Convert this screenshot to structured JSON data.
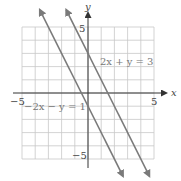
{
  "chart_data": {
    "type": "line",
    "title": "",
    "xlabel": "x",
    "ylabel": "y",
    "xlim": [
      -5,
      5
    ],
    "ylim": [
      -5,
      5
    ],
    "grid": true,
    "tick_labels": {
      "x": [
        "-5",
        "5"
      ],
      "y": [
        "5",
        "-5"
      ]
    },
    "series": [
      {
        "name": "2x + y = 3",
        "equation": "y = 3 - 2x",
        "slope": -2,
        "intercept": 3
      },
      {
        "name": "-2x - y = 1",
        "equation": "y = -1 - 2x",
        "slope": -2,
        "intercept": -1
      }
    ]
  },
  "labels": {
    "x_axis": "x",
    "y_axis": "y",
    "x_min": "−5",
    "x_max": "5",
    "y_max": "5",
    "y_min": "−5",
    "line1": "2x + y = 3",
    "line2": "−2x − y = 1"
  },
  "colors": {
    "grid": "#c8c8c8",
    "axis": "#333333",
    "line": "#7a7a7a"
  }
}
